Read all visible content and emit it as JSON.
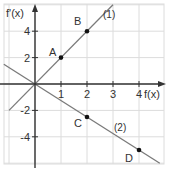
{
  "chart_data": {
    "type": "line",
    "title": "",
    "xlabel": "f(x)",
    "ylabel": "f'(x)",
    "xlim": [
      -1.2,
      5
    ],
    "ylim": [
      -6,
      6
    ],
    "grid": true,
    "x_ticks": [
      1,
      2,
      3,
      4
    ],
    "y_ticks": [
      4,
      2,
      -2,
      -4
    ],
    "x_tick_labels": [
      "1",
      "2",
      "3",
      "4"
    ],
    "y_tick_labels": [
      "4",
      "2",
      "-2",
      "-4"
    ],
    "series": [
      {
        "name": "(1)",
        "label": "(1)",
        "slope": 2,
        "x": [
          -1,
          3
        ],
        "y": [
          -2,
          6
        ]
      },
      {
        "name": "(2)",
        "label": "(2)",
        "slope": -1.25,
        "x": [
          -1.2,
          4.8
        ],
        "y": [
          1.5,
          -6
        ]
      }
    ],
    "points": [
      {
        "label": "A",
        "x": 1,
        "y": 2
      },
      {
        "label": "B",
        "x": 2,
        "y": 4
      },
      {
        "label": "C",
        "x": 2,
        "y": -2.5
      },
      {
        "label": "D",
        "x": 4,
        "y": -5
      }
    ],
    "colors": {
      "line": "#7a7a7a",
      "axis": "#333333",
      "grid": "#d8d8d8",
      "point": "#111111"
    }
  }
}
